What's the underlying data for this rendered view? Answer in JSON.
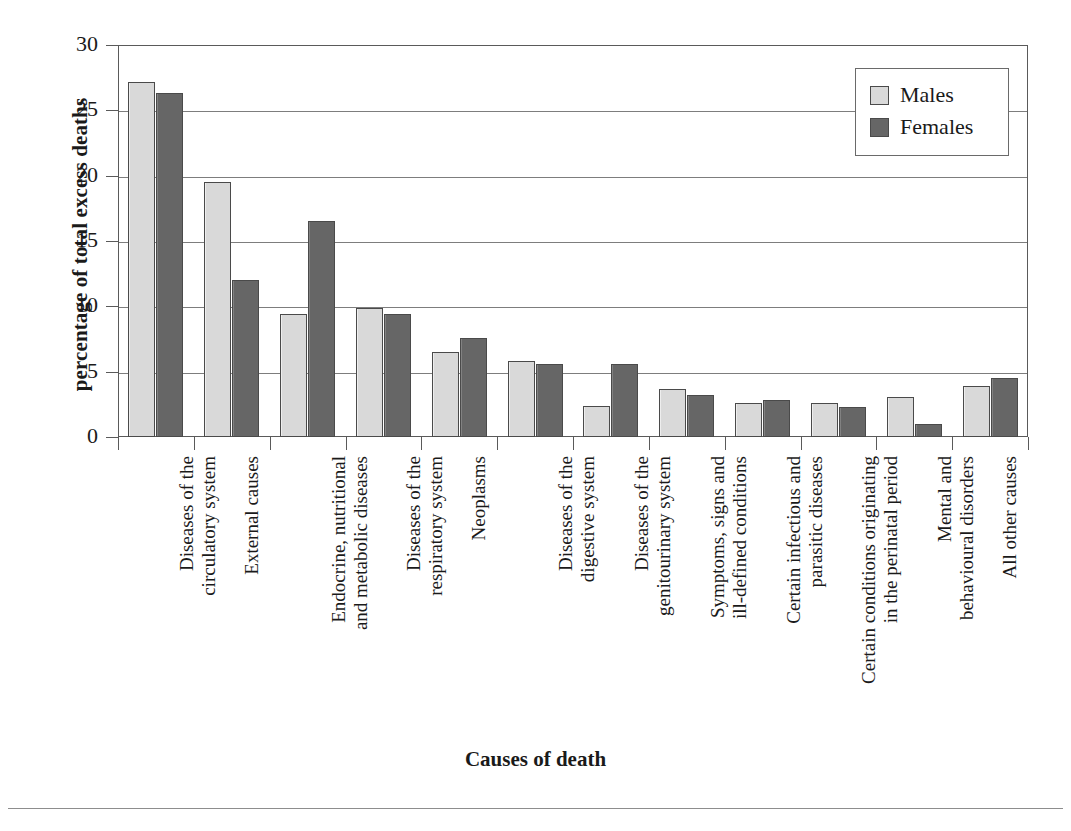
{
  "chart_data": {
    "type": "bar",
    "title": "",
    "xlabel": "Causes of death",
    "ylabel": "percentage of total excess deaths",
    "ylim": [
      0,
      30
    ],
    "yticks": [
      0,
      5,
      10,
      15,
      20,
      25,
      30
    ],
    "grid": true,
    "legend_position": "top-right",
    "categories": [
      "Diseases of the\ncirculatory system",
      "External causes",
      "Endocrine, nutritional\nand metabolic diseases",
      "Diseases of the\nrespiratory system",
      "Neoplasms",
      "Diseases of the\ndigestive system",
      "Diseases of the\ngenitourinary system",
      "Symptoms, signs and\nill-defined conditions",
      "Certain infectious and\nparasitic diseases",
      "Certain conditions originating\nin the perinatal period",
      "Mental and\nbehavioural disorders",
      "All other causes"
    ],
    "series": [
      {
        "name": "Males",
        "color": "#d9d9d9",
        "values": [
          27.2,
          19.5,
          9.4,
          9.9,
          6.5,
          5.8,
          2.4,
          3.7,
          2.6,
          2.6,
          3.1,
          3.9
        ]
      },
      {
        "name": "Females",
        "color": "#666666",
        "values": [
          26.3,
          12.0,
          16.5,
          9.4,
          7.6,
          5.6,
          5.6,
          3.2,
          2.8,
          2.3,
          1.0,
          4.5
        ]
      }
    ]
  },
  "axes": {
    "y_title": "percentage of total excess deaths",
    "x_title": "Causes of death"
  },
  "legend": {
    "items": [
      {
        "label": "Males",
        "swatch": "males"
      },
      {
        "label": "Females",
        "swatch": "females"
      }
    ]
  }
}
